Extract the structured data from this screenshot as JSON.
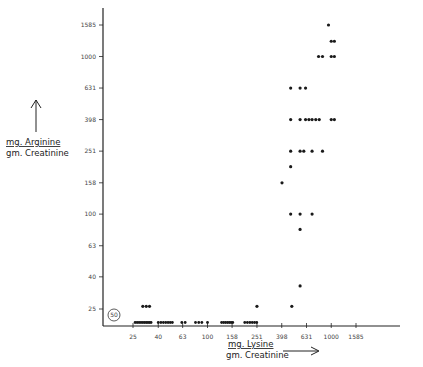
{
  "chart_data": {
    "type": "scatter",
    "title": "",
    "xlabel": "mg. Lysine / gm. Creatinine",
    "ylabel": "mg. Arginine / gm. Creatinine",
    "xlabel_lines": [
      "mg. Lysine",
      "gm. Creatinine"
    ],
    "ylabel_lines": [
      "mg. Arginine",
      "gm. Creatinine"
    ],
    "x_scale": "log",
    "y_scale": "log",
    "x_ticks": [
      25,
      40,
      63,
      100,
      158,
      251,
      398,
      631,
      1000,
      1585
    ],
    "x_tick_labels": [
      "25",
      "40",
      "63",
      "100",
      "158",
      "251",
      "398",
      "631",
      "1000",
      "1585"
    ],
    "y_ticks": [
      25,
      40,
      63,
      100,
      158,
      251,
      398,
      631,
      1000,
      1585
    ],
    "y_tick_labels": [
      "25",
      "40",
      "63",
      "100",
      "158",
      "251",
      "398",
      "631",
      "1000",
      "1585"
    ],
    "xlim": [
      20,
      2000
    ],
    "ylim": [
      20,
      2000
    ],
    "grid": false,
    "annotations": [
      {
        "text": "50",
        "note": "circled count of points at/below 25 near origin",
        "x": 24,
        "y": 25
      }
    ],
    "points": [
      [
        30,
        26
      ],
      [
        32,
        26
      ],
      [
        34,
        26
      ],
      [
        950,
        1585
      ],
      [
        1000,
        1250
      ],
      [
        1060,
        1250
      ],
      [
        1000,
        1000
      ],
      [
        1060,
        1000
      ],
      [
        790,
        1000
      ],
      [
        850,
        1000
      ],
      [
        470,
        631
      ],
      [
        620,
        631
      ],
      [
        560,
        631
      ],
      [
        470,
        398
      ],
      [
        560,
        398
      ],
      [
        620,
        398
      ],
      [
        660,
        398
      ],
      [
        700,
        398
      ],
      [
        750,
        398
      ],
      [
        800,
        398
      ],
      [
        1000,
        398
      ],
      [
        1060,
        398
      ],
      [
        470,
        251
      ],
      [
        560,
        251
      ],
      [
        600,
        251
      ],
      [
        700,
        251
      ],
      [
        850,
        251
      ],
      [
        470,
        200
      ],
      [
        400,
        158
      ],
      [
        470,
        100
      ],
      [
        560,
        100
      ],
      [
        700,
        100
      ],
      [
        560,
        80
      ],
      [
        251,
        26
      ],
      [
        480,
        26
      ],
      [
        560,
        35
      ]
    ],
    "baseline_points_y": 22,
    "baseline_points_x": [
      26,
      27,
      28,
      29,
      30,
      31,
      32,
      33,
      34,
      35,
      40,
      42,
      44,
      46,
      48,
      50,
      52,
      62,
      66,
      80,
      85,
      90,
      100,
      130,
      135,
      140,
      145,
      150,
      155,
      160,
      200,
      210,
      220,
      230,
      240,
      250
    ]
  }
}
